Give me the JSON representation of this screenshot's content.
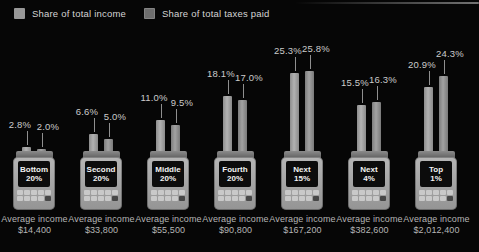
{
  "legend": {
    "income_label": "Share of total income",
    "taxes_label": "Share of total taxes paid"
  },
  "colors": {
    "background": "#060606",
    "income_bar": "#a2a2a2",
    "taxes_bar": "#8a8a8a",
    "percent_label_text": "#cbcbcb",
    "caption_text": "#b5b5b5",
    "screen_text": "#f2f2f2"
  },
  "chart_data": {
    "type": "bar",
    "unit": "percent",
    "title": "",
    "xlabel": "",
    "ylabel": "",
    "ylim": [
      0,
      26
    ],
    "grid": false,
    "legend_position": "top-left",
    "categories": [
      "Bottom 20%",
      "Second 20%",
      "Middle 20%",
      "Fourth 20%",
      "Next 15%",
      "Next 4%",
      "Top 1%"
    ],
    "series": [
      {
        "name": "Share of total income",
        "values": [
          2.8,
          6.6,
          11.0,
          18.1,
          25.3,
          15.5,
          20.9
        ]
      },
      {
        "name": "Share of total taxes paid",
        "values": [
          2.0,
          5.0,
          9.5,
          17.0,
          25.8,
          16.3,
          24.3
        ]
      }
    ],
    "groups": [
      {
        "screen_line1": "Bottom",
        "screen_line2": "20%",
        "income_pct": "2.8%",
        "taxes_pct": "2.0%",
        "caption_line1": "Average income",
        "caption_line2": "$14,400"
      },
      {
        "screen_line1": "Second",
        "screen_line2": "20%",
        "income_pct": "6.6%",
        "taxes_pct": "5.0%",
        "caption_line1": "Average income",
        "caption_line2": "$33,800"
      },
      {
        "screen_line1": "Middle",
        "screen_line2": "20%",
        "income_pct": "11.0%",
        "taxes_pct": "9.5%",
        "caption_line1": "Average income",
        "caption_line2": "$55,500"
      },
      {
        "screen_line1": "Fourth",
        "screen_line2": "20%",
        "income_pct": "18.1%",
        "taxes_pct": "17.0%",
        "caption_line1": "Average income",
        "caption_line2": "$90,800"
      },
      {
        "screen_line1": "Next",
        "screen_line2": "15%",
        "income_pct": "25.3%",
        "taxes_pct": "25.8%",
        "caption_line1": "Average income",
        "caption_line2": "$167,200"
      },
      {
        "screen_line1": "Next",
        "screen_line2": "4%",
        "income_pct": "15.5%",
        "taxes_pct": "16.3%",
        "caption_line1": "Average income",
        "caption_line2": "$382,600"
      },
      {
        "screen_line1": "Top",
        "screen_line2": "1%",
        "income_pct": "20.9%",
        "taxes_pct": "24.3%",
        "caption_line1": "Average income",
        "caption_line2": "$2,012,400"
      }
    ]
  }
}
